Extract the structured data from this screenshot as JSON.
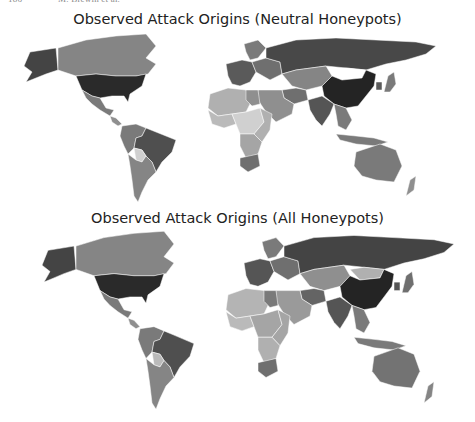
{
  "page_header": {
    "page_number": "186",
    "authors": "M. Brewin et al."
  },
  "chart_data": [
    {
      "type": "heatmap",
      "subtype": "choropleth-world-map",
      "title": "Observed Attack Origins (Neutral Honeypots)",
      "colormap": "grayscale (darker = more attacks)",
      "legend": "none",
      "regions": {
        "USA": 0.92,
        "Alaska": 0.8,
        "Canada": 0.5,
        "Mexico": 0.55,
        "Central America": 0.45,
        "Brazil": 0.75,
        "Colombia/Venezuela/Peru": 0.55,
        "Bolivia": 0.15,
        "Argentina/Chile": 0.5,
        "Western Europe": 0.7,
        "Eastern Europe": 0.6,
        "Scandinavia": 0.55,
        "Russia": 0.78,
        "Kazakhstan/Central Asia": 0.5,
        "China": 0.95,
        "Mongolia": 0.0,
        "India": 0.72,
        "Middle East": 0.45,
        "Iran": 0.6,
        "Southeast Asia": 0.55,
        "Indonesia": 0.55,
        "Japan": 0.55,
        "Korea": 0.7,
        "Australia": 0.55,
        "New Zealand": 0.45,
        "North Africa": 0.3,
        "Egypt": 0.45,
        "West Africa": 0.25,
        "Central Africa": 0.15,
        "East Africa": 0.3,
        "Southern Africa": 0.35,
        "South Africa": 0.6
      }
    },
    {
      "type": "heatmap",
      "subtype": "choropleth-world-map",
      "title": "Observed Attack Origins (All Honeypots)",
      "colormap": "grayscale (darker = more attacks)",
      "legend": "none",
      "regions": {
        "USA": 0.92,
        "Alaska": 0.8,
        "Canada": 0.5,
        "Mexico": 0.55,
        "Central America": 0.45,
        "Brazil": 0.75,
        "Colombia/Venezuela/Peru": 0.55,
        "Bolivia": 0.25,
        "Argentina/Chile": 0.5,
        "Western Europe": 0.72,
        "Eastern Europe": 0.6,
        "Scandinavia": 0.55,
        "Russia": 0.8,
        "Kazakhstan/Central Asia": 0.45,
        "China": 0.95,
        "Mongolia": 0.3,
        "India": 0.72,
        "Middle East": 0.4,
        "Iran": 0.65,
        "Southeast Asia": 0.55,
        "Indonesia": 0.55,
        "Japan": 0.6,
        "Korea": 0.72,
        "Australia": 0.58,
        "New Zealand": 0.5,
        "North Africa": 0.28,
        "Egypt": 0.55,
        "West Africa": 0.25,
        "Central Africa": 0.35,
        "East Africa": 0.35,
        "Southern Africa": 0.3,
        "South Africa": 0.6
      }
    }
  ],
  "panels": [
    {
      "title": "Observed Attack Origins (Neutral Honeypots)"
    },
    {
      "title": "Observed Attack Origins (All Honeypots)"
    }
  ]
}
